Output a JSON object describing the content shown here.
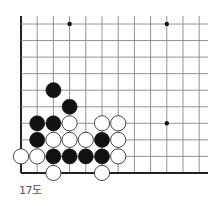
{
  "diagram": {
    "caption": "17도",
    "board": {
      "origin_x": 21,
      "origin_y": 24,
      "spacing_x": 16.2,
      "spacing_y": 16.55,
      "cols": 12,
      "rows": 10,
      "right_extent": 208,
      "top_extent": 16,
      "left_edge": true,
      "bottom_edge": true,
      "line_color": "#888888",
      "edge_color": "#222222"
    },
    "star_points": [
      {
        "col": 3,
        "row": 0
      },
      {
        "col": 9,
        "row": 0
      },
      {
        "col": 9,
        "row": 6
      }
    ],
    "stones": [
      {
        "color": "black",
        "col": 2,
        "row": 4
      },
      {
        "color": "black",
        "col": 3,
        "row": 5
      },
      {
        "color": "black",
        "col": 1,
        "row": 6
      },
      {
        "color": "black",
        "col": 2,
        "row": 6
      },
      {
        "color": "white",
        "col": 3,
        "row": 6
      },
      {
        "color": "white",
        "col": 5,
        "row": 6
      },
      {
        "color": "white",
        "col": 6,
        "row": 6
      },
      {
        "color": "black",
        "col": 1,
        "row": 7
      },
      {
        "color": "white",
        "col": 2,
        "row": 7
      },
      {
        "color": "white",
        "col": 3,
        "row": 7
      },
      {
        "color": "white",
        "col": 4,
        "row": 7
      },
      {
        "color": "black",
        "col": 5,
        "row": 7
      },
      {
        "color": "white",
        "col": 6,
        "row": 7
      },
      {
        "color": "white",
        "col": 0,
        "row": 8
      },
      {
        "color": "white",
        "col": 1,
        "row": 8
      },
      {
        "color": "black",
        "col": 2,
        "row": 8
      },
      {
        "color": "black",
        "col": 3,
        "row": 8
      },
      {
        "color": "black",
        "col": 4,
        "row": 8
      },
      {
        "color": "black",
        "col": 5,
        "row": 8
      },
      {
        "color": "white",
        "col": 6,
        "row": 8
      },
      {
        "color": "white",
        "col": 2,
        "row": 9
      },
      {
        "color": "white",
        "col": 5,
        "row": 9
      }
    ]
  }
}
